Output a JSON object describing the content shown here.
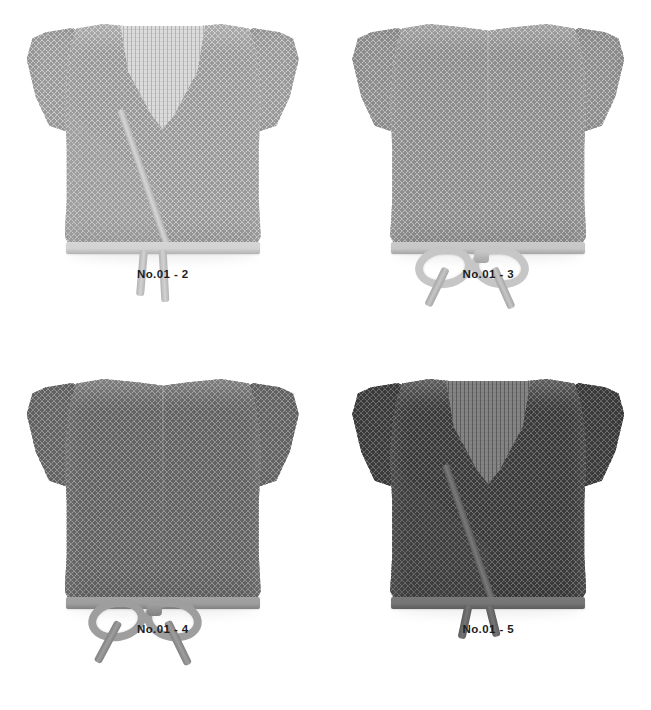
{
  "page": {
    "background_color": "#ffffff",
    "width": 651,
    "height": 710,
    "layout": "2x2-grid"
  },
  "items": [
    {
      "caption": "No.01 - 2",
      "view": "front",
      "position": "top-left",
      "closure": "wrap V-neck with two loose hanging ties",
      "colors": {
        "yarn": "#cfcfcf",
        "yarn_shadow": "#b3b3b3",
        "hole": "#9a9a9a",
        "band": "#d6d6d6",
        "tie": "#d2d2d2",
        "inner_panel": "#dcdcdc"
      }
    },
    {
      "caption": "No.01 - 3",
      "view": "back",
      "position": "top-right",
      "closure": "ribbon bow tied at hem",
      "colors": {
        "yarn": "#c3c3c3",
        "yarn_shadow": "#a6a6a6",
        "hole": "#8d8d8d",
        "band": "#cacaca",
        "tie": "#c6c6c6",
        "inner_panel": "#d2d2d2"
      }
    },
    {
      "caption": "No.01 - 4",
      "view": "back",
      "position": "bottom-left",
      "closure": "ribbon bow tied at hem",
      "colors": {
        "yarn": "#9b9b9b",
        "yarn_shadow": "#818181",
        "hole": "#636363",
        "band": "#a2a2a2",
        "tie": "#9e9e9e",
        "inner_panel": "#ababab"
      }
    },
    {
      "caption": "No.01 - 5",
      "view": "front",
      "position": "bottom-right",
      "closure": "wrap V-neck with two short hanging ties",
      "colors": {
        "yarn": "#727272",
        "yarn_shadow": "#5c5c5c",
        "hole": "#3b3b3b",
        "band": "#797979",
        "tie": "#757575",
        "inner_panel": "#848484"
      }
    }
  ]
}
